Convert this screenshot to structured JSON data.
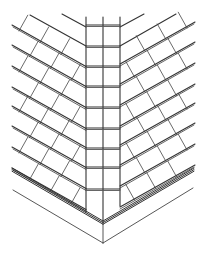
{
  "figure": {
    "title": "",
    "ink_color": "#333333",
    "background": "#ffffff",
    "course_count_each_side": 8,
    "center_column_rows": 9,
    "center_column_columns": 2
  }
}
